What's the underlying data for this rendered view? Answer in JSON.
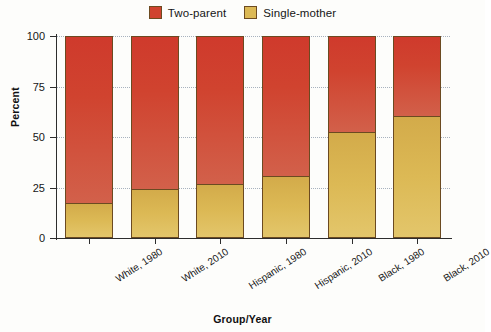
{
  "chart_data": {
    "type": "bar",
    "subtype": "stacked-percent",
    "title": "",
    "xlabel": "Group/Year",
    "ylabel": "Percent",
    "ylim": [
      0,
      100
    ],
    "yticks": [
      0,
      25,
      50,
      75,
      100
    ],
    "grid": true,
    "legend_position": "top-center",
    "categories": [
      "White, 1980",
      "White, 2010",
      "Hispanic, 1980",
      "Hispanic, 2010",
      "Black, 1980",
      "Black, 2010"
    ],
    "series": [
      {
        "name": "Single-mother",
        "color": "#dcb955",
        "values": [
          17,
          24,
          26,
          30,
          52,
          60
        ]
      },
      {
        "name": "Two-parent",
        "color": "#d0432f",
        "values": [
          83,
          76,
          74,
          70,
          48,
          40
        ]
      }
    ]
  },
  "legend": {
    "entries": [
      {
        "label": "Two-parent",
        "color": "#d0432f"
      },
      {
        "label": "Single-mother",
        "color": "#dcb955"
      }
    ]
  },
  "axes": {
    "y_title": "Percent",
    "x_title": "Group/Year",
    "y_tick_labels": [
      "100",
      "75",
      "50",
      "25",
      "0"
    ],
    "x_tick_labels": [
      "White, 1980",
      "White, 2010",
      "Hispanic, 1980",
      "Hispanic, 2010",
      "Black, 1980",
      "Black, 2010"
    ]
  }
}
